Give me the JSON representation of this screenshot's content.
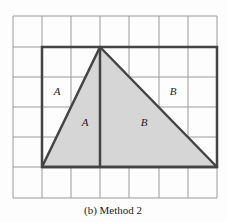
{
  "figure": {
    "caption": "(b) Method 2",
    "grid": {
      "columns": 7,
      "rows": 6,
      "x_lines": [
        13,
        42,
        71,
        100,
        129,
        159,
        188,
        217
      ],
      "y_lines": [
        16,
        47,
        77,
        107,
        137,
        167,
        198
      ],
      "color": "#9a9a9a"
    },
    "rectangle": {
      "x1": 42,
      "y1": 47,
      "x2": 217,
      "y2": 167,
      "stroke": "#444444"
    },
    "triangle": {
      "points": [
        [
          42,
          167
        ],
        [
          100,
          47
        ],
        [
          217,
          167
        ]
      ],
      "fill": "#d6d6d6",
      "stroke": "#444444"
    },
    "divider": {
      "x": 100,
      "y1": 47,
      "y2": 167
    },
    "labels": [
      {
        "text": "A",
        "x": 57,
        "y": 95,
        "region": "outside-left"
      },
      {
        "text": "A",
        "x": 85,
        "y": 126,
        "region": "inside-left"
      },
      {
        "text": "B",
        "x": 173,
        "y": 95,
        "region": "outside-right"
      },
      {
        "text": "B",
        "x": 144,
        "y": 126,
        "region": "inside-right"
      }
    ]
  }
}
